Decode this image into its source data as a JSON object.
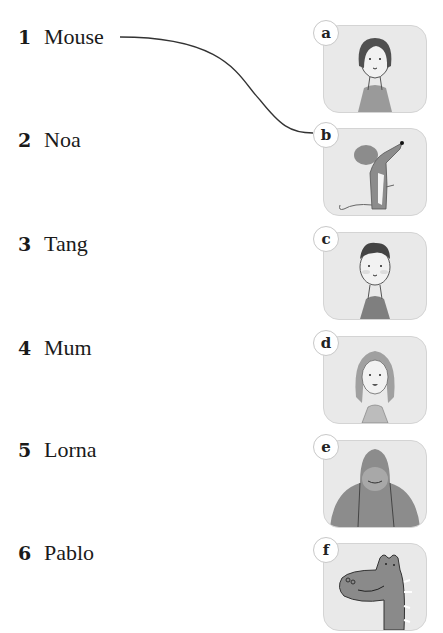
{
  "exercise": {
    "type": "matching",
    "names": [
      {
        "number": "1",
        "name": "Mouse"
      },
      {
        "number": "2",
        "name": "Noa"
      },
      {
        "number": "3",
        "name": "Tang"
      },
      {
        "number": "4",
        "name": "Mum"
      },
      {
        "number": "5",
        "name": "Lorna"
      },
      {
        "number": "6",
        "name": "Pablo"
      }
    ],
    "pictures": [
      {
        "letter": "a",
        "depicts": "girl with dark bob hair"
      },
      {
        "letter": "b",
        "depicts": "grey mouse"
      },
      {
        "letter": "c",
        "depicts": "boy with dark hair"
      },
      {
        "letter": "d",
        "depicts": "woman with long hair"
      },
      {
        "letter": "e",
        "depicts": "orangutan"
      },
      {
        "letter": "f",
        "depicts": "dinosaur"
      }
    ],
    "example_match": {
      "from": "1",
      "to": "b"
    }
  },
  "colors": {
    "card_bg": "#e9e9e9",
    "line": "#333333",
    "illustration_grey": "#8c8c8c"
  }
}
